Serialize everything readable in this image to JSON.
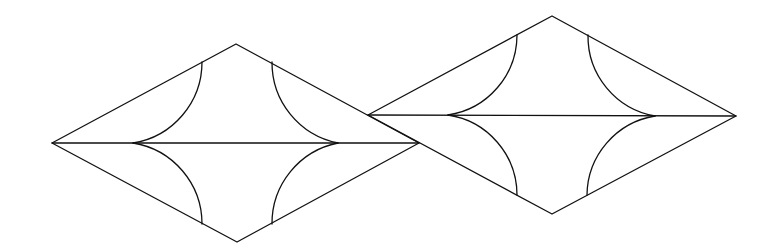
{
  "diagram": {
    "stroke_color": "#111111",
    "background_color": "#ffffff",
    "shapes": [
      {
        "name": "left-rhombus",
        "arc_count": 4,
        "has_horizontal_diagonal": true
      },
      {
        "name": "right-rhombus",
        "arc_count": 4,
        "has_horizontal_diagonal": true
      }
    ]
  }
}
